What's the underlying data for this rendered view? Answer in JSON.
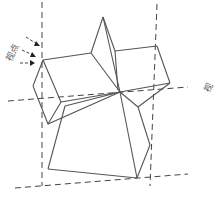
{
  "figure": {
    "type": "origami-perspective-diagram",
    "labels": {
      "viewpoint_left": "视点",
      "viewpoint_right": "视"
    },
    "colors": {
      "line": "#555555",
      "dash": "#444444",
      "background": "#ffffff"
    }
  }
}
